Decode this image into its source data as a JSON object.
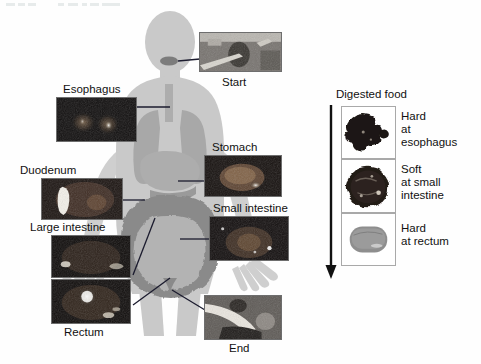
{
  "figure": {
    "kind": "annotated-anatomical-diagram"
  },
  "body_diagram": {
    "silhouette_color": "#c9c9c9",
    "organ_color": "#a8a8a8",
    "intestine_color": "#8a8a8a",
    "marker_color": "#7a7a7a"
  },
  "tract_labels": [
    {
      "id": "start",
      "label": "Start"
    },
    {
      "id": "esophagus",
      "label": "Esophagus"
    },
    {
      "id": "stomach",
      "label": "Stomach"
    },
    {
      "id": "duodenum",
      "label": "Duodenum"
    },
    {
      "id": "small-intestine",
      "label": "Small intestine"
    },
    {
      "id": "large-intestine",
      "label": "Large intestine"
    },
    {
      "id": "rectum",
      "label": "Rectum"
    },
    {
      "id": "end",
      "label": "End"
    }
  ],
  "digested_food_panel": {
    "title": "Digested food",
    "arrow": "downward-arrow",
    "rows": [
      {
        "id": "row-esophagus",
        "sample": "dark-irregular-solid-mass",
        "text": "Hard\nat\nesophagus",
        "line1": "Hard",
        "line2": "at",
        "line3": "esophagus"
      },
      {
        "id": "row-small-intestine",
        "sample": "dark-round-soft-mass",
        "text": "Soft\nat small\nintestine",
        "line1": "Soft",
        "line2": "at small",
        "line3": "intestine"
      },
      {
        "id": "row-rectum",
        "sample": "gray-smooth-oval-pellet",
        "text": "Hard\nat rectum",
        "line1": "Hard",
        "line2": "at rectum",
        "line3": ""
      }
    ]
  },
  "colors": {
    "text": "#111111",
    "panel_border": "#a9a9a9",
    "photo_border": "#6e6e6e",
    "connector": "#1b1b2e",
    "background": "#ffffff"
  }
}
